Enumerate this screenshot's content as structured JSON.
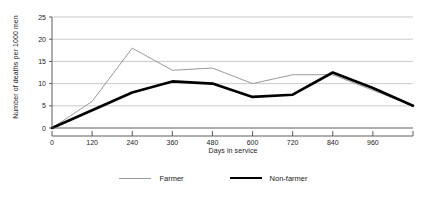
{
  "chart_data": {
    "type": "line",
    "title": "",
    "xlabel": "Days in service",
    "ylabel": "Number of deaths per 1000 men",
    "x": [
      0,
      120,
      240,
      360,
      480,
      600,
      720,
      840,
      960,
      1080
    ],
    "xticks": [
      0,
      120,
      240,
      360,
      480,
      600,
      720,
      840,
      960
    ],
    "xtick_labels": [
      "0",
      "120",
      "240",
      "360",
      "480",
      "600",
      "720",
      "840",
      "960"
    ],
    "yticks": [
      0,
      5,
      10,
      15,
      20,
      25
    ],
    "ytick_labels": [
      "0",
      "5",
      "10",
      "15",
      "20",
      "25"
    ],
    "xlim": [
      0,
      1080
    ],
    "ylim": [
      0,
      25
    ],
    "grid": true,
    "legend_position": "bottom",
    "series": [
      {
        "name": "Farmer",
        "color": "#9a9a9a",
        "line_width": 1,
        "values": [
          0,
          6,
          18,
          13,
          13.5,
          10,
          12,
          12,
          8.5,
          5
        ]
      },
      {
        "name": "Non-farmer",
        "color": "#000000",
        "line_width": 2.6,
        "values": [
          0,
          4,
          8,
          10.5,
          10,
          7,
          7.5,
          12.5,
          9,
          5
        ]
      }
    ]
  },
  "legend": {
    "items": [
      {
        "label": "Farmer",
        "swatch": "thin-gray-line"
      },
      {
        "label": "Non-farmer",
        "swatch": "thick-black-line"
      }
    ]
  },
  "colors": {
    "farmer_line": "#9a9a9a",
    "nonfarmer_line": "#000000",
    "gridline": "#b5b5b5",
    "axis": "#4d4d4d",
    "text": "#1a1a1a",
    "background": "#ffffff"
  }
}
